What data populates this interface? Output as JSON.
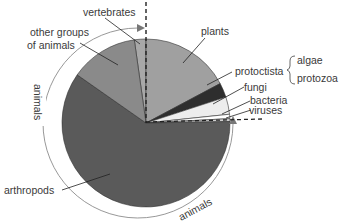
{
  "chart_data": {
    "type": "pie",
    "title": "",
    "slices": [
      {
        "name": "vertebrates",
        "start_deg": -8,
        "end_deg": 0,
        "percent": 2.2,
        "color": "#a8a8a8"
      },
      {
        "name": "plants",
        "start_deg": 0,
        "end_deg": 62,
        "percent": 17.2,
        "color": "#a0a0a0"
      },
      {
        "name": "protoctista",
        "start_deg": 62,
        "end_deg": 72,
        "percent": 2.8,
        "color": "#2e2e2e"
      },
      {
        "name": "fungi",
        "start_deg": 72,
        "end_deg": 84,
        "percent": 3.3,
        "color": "#ededed"
      },
      {
        "name": "bacteria",
        "start_deg": 84,
        "end_deg": 87,
        "percent": 0.8,
        "color": "#ffffff"
      },
      {
        "name": "viruses",
        "start_deg": 87,
        "end_deg": 89,
        "percent": 0.6,
        "color": "#cfcfcf"
      },
      {
        "name": "arthropods",
        "start_deg": 89,
        "end_deg": 305,
        "percent": 60.0,
        "color": "#5a5a5a"
      },
      {
        "name": "other groups of animals",
        "start_deg": 305,
        "end_deg": 352,
        "percent": 13.1,
        "color": "#8a8a8a"
      }
    ],
    "annotations": [
      {
        "text": "animals",
        "type": "arc-bracket",
        "spans": [
          "vertebrates",
          "arthropods",
          "other groups of animals"
        ]
      },
      {
        "text": "algae",
        "type": "brace-group",
        "attached_to": "protoctista"
      },
      {
        "text": "protozoa",
        "type": "brace-group",
        "attached_to": "protoctista"
      }
    ],
    "legend": "none (direct labels)"
  },
  "labels": {
    "vertebrates": "vertebrates",
    "other_line1": "other groups",
    "other_line2": "of animals",
    "plants": "plants",
    "protoctista": "protoctista",
    "algae": "algae",
    "protozoa": "protozoa",
    "fungi": "fungi",
    "bacteria": "bacteria",
    "viruses": "viruses",
    "arthropods": "arthropods",
    "animals_left": "animals",
    "animals_bottom": "animals"
  }
}
